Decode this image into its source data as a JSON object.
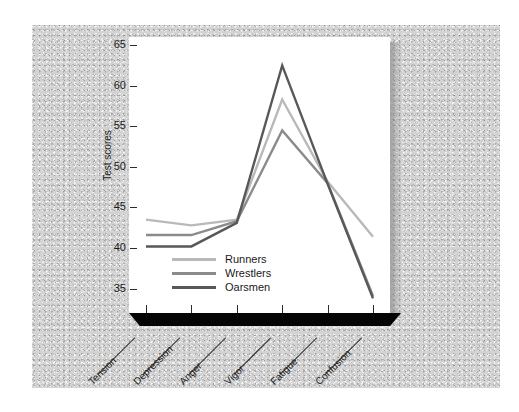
{
  "chart_data": {
    "type": "line",
    "title": "",
    "xlabel": "",
    "ylabel": "Test scores",
    "categories": [
      "Tension",
      "Depression",
      "Anger",
      "Vigor",
      "Fatigue",
      "Confusion"
    ],
    "ylim": [
      32,
      66
    ],
    "yticks": [
      35,
      40,
      45,
      50,
      55,
      60,
      65
    ],
    "grid": false,
    "legend_position": "inside lower-left",
    "series": [
      {
        "name": "Runners",
        "color": "#b9b9b9",
        "values": [
          43.5,
          42.8,
          43.5,
          58.3,
          48.2,
          41.4
        ]
      },
      {
        "name": "Wrestlers",
        "color": "#8b8b8b",
        "values": [
          41.6,
          41.6,
          43.3,
          54.5,
          48.0,
          34.1
        ]
      },
      {
        "name": "Oarsmen",
        "color": "#585858",
        "values": [
          40.2,
          40.2,
          43.1,
          62.5,
          47.9,
          33.8
        ]
      }
    ]
  },
  "axes": {
    "y_title": "Test scores",
    "y_tick_labels": [
      "65",
      "60",
      "55",
      "50",
      "45",
      "40",
      "35"
    ],
    "x_tick_labels": [
      "Tension",
      "Depression",
      "Anger",
      "Vigor",
      "Fatigue",
      "Confusion"
    ]
  },
  "legend": {
    "entries": [
      {
        "label": "Runners"
      },
      {
        "label": "Wrestlers"
      },
      {
        "label": "Oarsmen"
      }
    ]
  },
  "colors": {
    "runners": "#b9b9b9",
    "wrestlers": "#8b8b8b",
    "oarsmen": "#585858",
    "panel_face": "#ffffff",
    "base_slab": "#050505",
    "backdrop": "#d3d3d3",
    "page": "#ffffff"
  }
}
